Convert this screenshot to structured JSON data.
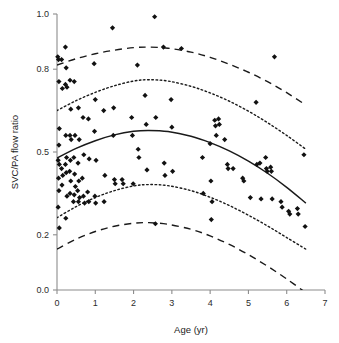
{
  "chart_data": {
    "type": "scatter",
    "title": "",
    "xlabel": "Age (yr)",
    "ylabel": "SVC/PA flow ratio",
    "xlim": [
      0,
      7
    ],
    "ylim": [
      0.0,
      1.0
    ],
    "xticks": [
      0,
      1,
      2,
      3,
      4,
      5,
      6,
      7
    ],
    "xtick_labels": [
      "0",
      "1",
      "2",
      "3",
      "4",
      "5",
      "6",
      "7"
    ],
    "yticks": [
      0.0,
      0.2,
      0.5,
      0.8,
      1.0
    ],
    "ytick_labels": [
      "0.0",
      "0.2",
      "0.5",
      "0.8",
      "1.0"
    ],
    "grid": false,
    "legend": "none",
    "marker": "diamond",
    "marker_color": "#111111",
    "points": [
      [
        0.02,
        0.845
      ],
      [
        0.04,
        0.835
      ],
      [
        0.05,
        0.755
      ],
      [
        0.06,
        0.585
      ],
      [
        0.05,
        0.525
      ],
      [
        0.03,
        0.47
      ],
      [
        0.06,
        0.455
      ],
      [
        0.04,
        0.405
      ],
      [
        0.05,
        0.36
      ],
      [
        0.03,
        0.3
      ],
      [
        0.06,
        0.225
      ],
      [
        0.12,
        0.835
      ],
      [
        0.14,
        0.73
      ],
      [
        0.12,
        0.44
      ],
      [
        0.15,
        0.415
      ],
      [
        0.13,
        0.38
      ],
      [
        0.22,
        0.88
      ],
      [
        0.24,
        0.805
      ],
      [
        0.22,
        0.745
      ],
      [
        0.26,
        0.735
      ],
      [
        0.23,
        0.56
      ],
      [
        0.25,
        0.48
      ],
      [
        0.22,
        0.455
      ],
      [
        0.24,
        0.425
      ],
      [
        0.26,
        0.34
      ],
      [
        0.23,
        0.26
      ],
      [
        0.34,
        0.76
      ],
      [
        0.36,
        0.655
      ],
      [
        0.34,
        0.56
      ],
      [
        0.37,
        0.545
      ],
      [
        0.35,
        0.47
      ],
      [
        0.33,
        0.43
      ],
      [
        0.36,
        0.395
      ],
      [
        0.34,
        0.35
      ],
      [
        0.45,
        0.755
      ],
      [
        0.47,
        0.56
      ],
      [
        0.44,
        0.48
      ],
      [
        0.46,
        0.42
      ],
      [
        0.48,
        0.375
      ],
      [
        0.45,
        0.345
      ],
      [
        0.43,
        0.32
      ],
      [
        0.56,
        0.66
      ],
      [
        0.58,
        0.545
      ],
      [
        0.55,
        0.46
      ],
      [
        0.57,
        0.395
      ],
      [
        0.54,
        0.36
      ],
      [
        0.59,
        0.335
      ],
      [
        0.56,
        0.32
      ],
      [
        0.68,
        0.625
      ],
      [
        0.7,
        0.49
      ],
      [
        0.66,
        0.405
      ],
      [
        0.69,
        0.34
      ],
      [
        0.72,
        0.315
      ],
      [
        0.82,
        0.62
      ],
      [
        0.84,
        0.475
      ],
      [
        0.8,
        0.355
      ],
      [
        0.83,
        0.32
      ],
      [
        0.97,
        0.82
      ],
      [
        1.0,
        0.69
      ],
      [
        0.98,
        0.575
      ],
      [
        1.02,
        0.47
      ],
      [
        0.99,
        0.34
      ],
      [
        1.01,
        0.315
      ],
      [
        1.22,
        0.65
      ],
      [
        1.25,
        0.415
      ],
      [
        1.23,
        0.32
      ],
      [
        1.45,
        0.95
      ],
      [
        1.48,
        0.66
      ],
      [
        1.47,
        0.56
      ],
      [
        1.5,
        0.4
      ],
      [
        1.52,
        0.385
      ],
      [
        1.7,
        0.4
      ],
      [
        1.73,
        0.385
      ],
      [
        1.95,
        0.625
      ],
      [
        1.97,
        0.56
      ],
      [
        1.99,
        0.385
      ],
      [
        2.1,
        0.815
      ],
      [
        2.12,
        0.51
      ],
      [
        2.14,
        0.48
      ],
      [
        2.3,
        0.705
      ],
      [
        2.33,
        0.6
      ],
      [
        2.35,
        0.435
      ],
      [
        2.55,
        0.99
      ],
      [
        2.58,
        0.625
      ],
      [
        2.57,
        0.24
      ],
      [
        2.78,
        0.88
      ],
      [
        2.8,
        0.46
      ],
      [
        2.82,
        0.415
      ],
      [
        2.98,
        0.69
      ],
      [
        3.0,
        0.59
      ],
      [
        3.02,
        0.43
      ],
      [
        3.25,
        0.875
      ],
      [
        3.8,
        0.48
      ],
      [
        3.82,
        0.35
      ],
      [
        4.0,
        0.53
      ],
      [
        4.02,
        0.395
      ],
      [
        4.05,
        0.32
      ],
      [
        4.03,
        0.255
      ],
      [
        4.12,
        0.615
      ],
      [
        4.14,
        0.595
      ],
      [
        4.16,
        0.56
      ],
      [
        4.22,
        0.62
      ],
      [
        4.24,
        0.6
      ],
      [
        4.38,
        0.545
      ],
      [
        4.45,
        0.455
      ],
      [
        4.47,
        0.44
      ],
      [
        4.6,
        0.44
      ],
      [
        4.85,
        0.405
      ],
      [
        4.88,
        0.395
      ],
      [
        5.05,
        0.335
      ],
      [
        5.2,
        0.68
      ],
      [
        5.22,
        0.455
      ],
      [
        5.3,
        0.46
      ],
      [
        5.33,
        0.33
      ],
      [
        5.45,
        0.48
      ],
      [
        5.47,
        0.44
      ],
      [
        5.49,
        0.43
      ],
      [
        5.58,
        0.445
      ],
      [
        5.6,
        0.43
      ],
      [
        5.62,
        0.33
      ],
      [
        5.68,
        0.845
      ],
      [
        5.85,
        0.32
      ],
      [
        5.88,
        0.3
      ],
      [
        6.05,
        0.285
      ],
      [
        6.08,
        0.275
      ],
      [
        6.28,
        0.295
      ],
      [
        6.3,
        0.275
      ],
      [
        6.45,
        0.49
      ],
      [
        6.48,
        0.23
      ]
    ],
    "curves": [
      {
        "name": "upper-95-bound",
        "style": "dashed",
        "description": "upper dashed prediction band",
        "points": [
          [
            0.0,
            0.815
          ],
          [
            0.5,
            0.838
          ],
          [
            1.0,
            0.856
          ],
          [
            1.5,
            0.869
          ],
          [
            2.0,
            0.878
          ],
          [
            2.4,
            0.88
          ],
          [
            2.9,
            0.876
          ],
          [
            3.5,
            0.862
          ],
          [
            4.0,
            0.843
          ],
          [
            4.5,
            0.818
          ],
          [
            5.0,
            0.789
          ],
          [
            5.5,
            0.755
          ],
          [
            6.0,
            0.715
          ],
          [
            6.5,
            0.67
          ]
        ]
      },
      {
        "name": "upper-quartile-bound",
        "style": "dotted",
        "description": "upper dotted confidence band",
        "points": [
          [
            0.0,
            0.65
          ],
          [
            0.5,
            0.686
          ],
          [
            1.0,
            0.716
          ],
          [
            1.5,
            0.74
          ],
          [
            2.0,
            0.757
          ],
          [
            2.4,
            0.762
          ],
          [
            2.9,
            0.757
          ],
          [
            3.5,
            0.738
          ],
          [
            4.0,
            0.714
          ],
          [
            4.5,
            0.684
          ],
          [
            5.0,
            0.648
          ],
          [
            5.5,
            0.606
          ],
          [
            6.0,
            0.56
          ],
          [
            6.5,
            0.51
          ]
        ]
      },
      {
        "name": "fitted-mean",
        "style": "solid",
        "description": "fitted quadratic regression line",
        "points": [
          [
            0.0,
            0.478
          ],
          [
            0.5,
            0.513
          ],
          [
            1.0,
            0.541
          ],
          [
            1.5,
            0.562
          ],
          [
            2.0,
            0.575
          ],
          [
            2.4,
            0.578
          ],
          [
            2.9,
            0.574
          ],
          [
            3.5,
            0.557
          ],
          [
            4.0,
            0.534
          ],
          [
            4.5,
            0.504
          ],
          [
            5.0,
            0.467
          ],
          [
            5.5,
            0.423
          ],
          [
            6.0,
            0.372
          ],
          [
            6.5,
            0.315
          ]
        ]
      },
      {
        "name": "lower-quartile-bound",
        "style": "dotted",
        "description": "lower dotted confidence band",
        "points": [
          [
            0.0,
            0.262
          ],
          [
            0.5,
            0.302
          ],
          [
            1.0,
            0.335
          ],
          [
            1.5,
            0.36
          ],
          [
            2.0,
            0.377
          ],
          [
            2.4,
            0.382
          ],
          [
            2.9,
            0.378
          ],
          [
            3.5,
            0.36
          ],
          [
            4.0,
            0.336
          ],
          [
            4.5,
            0.306
          ],
          [
            5.0,
            0.271
          ],
          [
            5.5,
            0.232
          ],
          [
            6.0,
            0.19
          ],
          [
            6.5,
            0.148
          ]
        ]
      },
      {
        "name": "lower-95-bound",
        "style": "dashed",
        "description": "lower dashed prediction band",
        "points": [
          [
            0.0,
            0.148
          ],
          [
            0.5,
            0.184
          ],
          [
            1.0,
            0.212
          ],
          [
            1.5,
            0.231
          ],
          [
            2.0,
            0.242
          ],
          [
            2.4,
            0.244
          ],
          [
            2.9,
            0.238
          ],
          [
            3.5,
            0.22
          ],
          [
            4.0,
            0.196
          ],
          [
            4.5,
            0.165
          ],
          [
            5.0,
            0.128
          ],
          [
            5.5,
            0.086
          ],
          [
            6.0,
            0.04
          ],
          [
            6.5,
            -0.01
          ]
        ]
      }
    ]
  }
}
